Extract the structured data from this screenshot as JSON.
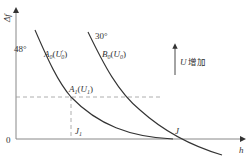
{
  "diagram": {
    "type": "line-diagram",
    "y_axis_label": "Δf",
    "x_axis_label": "h",
    "origin_label": "0",
    "curves": [
      {
        "id": "A",
        "angle_label": "48°",
        "name_main": "A",
        "name_sub": "0",
        "param_main": "U",
        "param_sup": "′",
        "param_sub": "0"
      },
      {
        "id": "B",
        "angle_label": "30°",
        "name_main": "B",
        "name_sub": "0",
        "param_main": "U",
        "param_sub": "0"
      }
    ],
    "point_A1": {
      "main": "A",
      "sub": "1",
      "param_main": "U",
      "param_sub": "1"
    },
    "point_J1": {
      "main": "J",
      "sub": "1"
    },
    "point_J": {
      "main": "J"
    },
    "direction_annotation": {
      "var": "U",
      "text": "增加"
    },
    "colors": {
      "line": "#333333",
      "axis": "#888888",
      "dashed": "#999999"
    }
  }
}
